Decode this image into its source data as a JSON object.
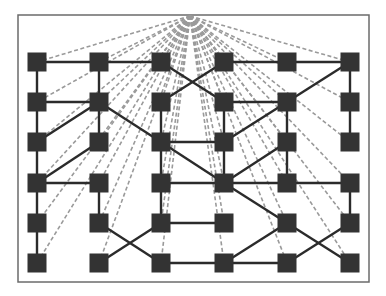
{
  "diagram": {
    "frame": {
      "x": 18,
      "y": 15,
      "width": 351,
      "height": 267,
      "stroke": "#6b6b6b"
    },
    "hub": {
      "x": 190,
      "y": 16
    },
    "columns": [
      37,
      99,
      161,
      224,
      287,
      350
    ],
    "rows": [
      62,
      102,
      142,
      183,
      223,
      263
    ],
    "node_size": 19,
    "node_color": "#333333",
    "edge_color": "#2b2b2b",
    "dashed_color": "#9a9a9a",
    "edges": [
      [
        [
          0,
          0
        ],
        [
          1,
          0
        ]
      ],
      [
        [
          1,
          0
        ],
        [
          2,
          0
        ]
      ],
      [
        [
          3,
          0
        ],
        [
          4,
          0
        ]
      ],
      [
        [
          4,
          0
        ],
        [
          5,
          0
        ]
      ],
      [
        [
          2,
          0
        ],
        [
          3,
          1
        ]
      ],
      [
        [
          3,
          0
        ],
        [
          2,
          1
        ]
      ],
      [
        [
          0,
          0
        ],
        [
          0,
          1
        ]
      ],
      [
        [
          0,
          1
        ],
        [
          0,
          2
        ]
      ],
      [
        [
          0,
          2
        ],
        [
          0,
          3
        ]
      ],
      [
        [
          0,
          3
        ],
        [
          0,
          4
        ]
      ],
      [
        [
          0,
          4
        ],
        [
          0,
          5
        ]
      ],
      [
        [
          1,
          0
        ],
        [
          1,
          1
        ]
      ],
      [
        [
          1,
          1
        ],
        [
          1,
          2
        ]
      ],
      [
        [
          1,
          3
        ],
        [
          1,
          4
        ]
      ],
      [
        [
          0,
          1
        ],
        [
          1,
          1
        ]
      ],
      [
        [
          1,
          1
        ],
        [
          0,
          2
        ]
      ],
      [
        [
          1,
          1
        ],
        [
          2,
          2
        ]
      ],
      [
        [
          1,
          2
        ],
        [
          0,
          3
        ]
      ],
      [
        [
          0,
          3
        ],
        [
          1,
          3
        ]
      ],
      [
        [
          2,
          1
        ],
        [
          2,
          2
        ]
      ],
      [
        [
          2,
          2
        ],
        [
          2,
          3
        ]
      ],
      [
        [
          2,
          3
        ],
        [
          2,
          4
        ]
      ],
      [
        [
          3,
          1
        ],
        [
          3,
          2
        ]
      ],
      [
        [
          3,
          2
        ],
        [
          3,
          3
        ]
      ],
      [
        [
          3,
          1
        ],
        [
          4,
          1
        ]
      ],
      [
        [
          4,
          1
        ],
        [
          5,
          0
        ]
      ],
      [
        [
          3,
          2
        ],
        [
          4,
          1
        ]
      ],
      [
        [
          4,
          1
        ],
        [
          4,
          2
        ]
      ],
      [
        [
          5,
          0
        ],
        [
          5,
          1
        ]
      ],
      [
        [
          5,
          1
        ],
        [
          5,
          2
        ]
      ],
      [
        [
          2,
          2
        ],
        [
          3,
          2
        ]
      ],
      [
        [
          2,
          2
        ],
        [
          3,
          3
        ]
      ],
      [
        [
          2,
          3
        ],
        [
          3,
          3
        ]
      ],
      [
        [
          3,
          3
        ],
        [
          4,
          2
        ]
      ],
      [
        [
          3,
          3
        ],
        [
          4,
          3
        ]
      ],
      [
        [
          4,
          3
        ],
        [
          5,
          3
        ]
      ],
      [
        [
          4,
          2
        ],
        [
          4,
          3
        ]
      ],
      [
        [
          3,
          3
        ],
        [
          4,
          4
        ]
      ],
      [
        [
          5,
          3
        ],
        [
          5,
          4
        ]
      ],
      [
        [
          1,
          4
        ],
        [
          2,
          5
        ]
      ],
      [
        [
          1,
          5
        ],
        [
          2,
          4
        ]
      ],
      [
        [
          2,
          4
        ],
        [
          3,
          4
        ]
      ],
      [
        [
          2,
          5
        ],
        [
          3,
          5
        ]
      ],
      [
        [
          3,
          5
        ],
        [
          4,
          4
        ]
      ],
      [
        [
          3,
          5
        ],
        [
          4,
          5
        ]
      ],
      [
        [
          4,
          4
        ],
        [
          5,
          5
        ]
      ],
      [
        [
          4,
          5
        ],
        [
          5,
          4
        ]
      ]
    ]
  }
}
